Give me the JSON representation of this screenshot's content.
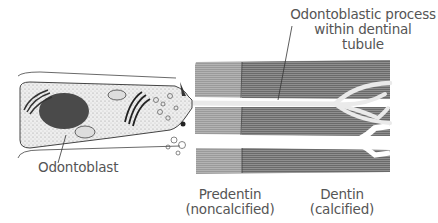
{
  "diagram": {
    "labels": {
      "process": [
        "Odontoblastic process",
        "within dentinal",
        "tubule"
      ],
      "odontoblast": "Odontoblast",
      "predentin": [
        "Predentin",
        "(noncalcified)"
      ],
      "dentin": [
        "Dentin",
        "(calcified)"
      ]
    },
    "colors": {
      "predentin": "#9a9a9a",
      "dentin": "#6a6a6a",
      "cell_fill": "#ececec",
      "nucleus": "#4a4a4a",
      "process": "#f2f2f2",
      "text": "#555555",
      "line": "#333333"
    }
  }
}
